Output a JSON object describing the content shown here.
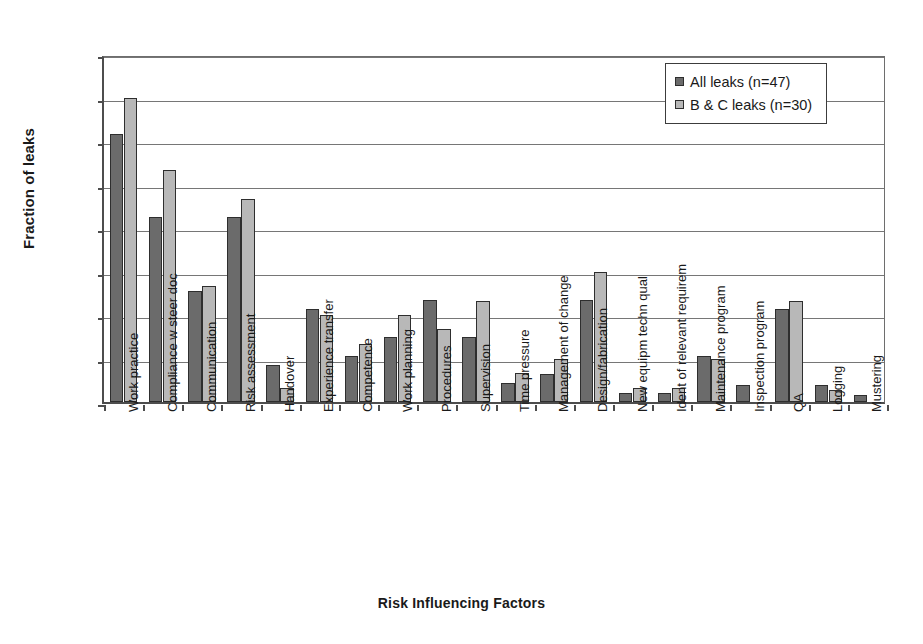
{
  "chart_data": {
    "type": "bar",
    "title": "",
    "xlabel": "Risk Influencing Factors",
    "ylabel": "Fraction of leaks",
    "ylim": [
      0,
      0.8
    ],
    "ytick_labels": [
      "0.8",
      "0.7",
      "0.6",
      "0.5",
      "0.4",
      "0.3",
      "0.2",
      "0.1",
      "0"
    ],
    "ytick_values": [
      0.8,
      0.7,
      0.6,
      0.5,
      0.4,
      0.3,
      0.2,
      0.1,
      0
    ],
    "grid": "horizontal",
    "legend_position": "top-right",
    "categories": [
      "Work practice",
      "Compliance w steer doc",
      "Communication",
      "Risk assessment",
      "Handover",
      "Experience transfer",
      "Competence",
      "Work planning",
      "Procedures",
      "Supervision",
      "Time pressure",
      "Management of change",
      "Design/fabrication",
      "New equipm techn qual",
      "Ident of relevant requirem",
      "Maintenance program",
      "Inspection program",
      "QA",
      "Logging",
      "Mustering"
    ],
    "series": [
      {
        "name": "All leaks (n=47)",
        "color": "#6b6b6b",
        "values": [
          0.617,
          0.426,
          0.255,
          0.426,
          0.085,
          0.213,
          0.106,
          0.149,
          0.234,
          0.149,
          0.043,
          0.064,
          0.234,
          0.021,
          0.021,
          0.106,
          0.038,
          0.213,
          0.038,
          0.017
        ]
      },
      {
        "name": "B & C leaks (n=30)",
        "color": "#b8b8b8",
        "values": [
          0.7,
          0.533,
          0.267,
          0.467,
          0.033,
          0.2,
          0.133,
          0.2,
          0.167,
          0.233,
          0.067,
          0.1,
          0.3,
          0.033,
          0.033,
          0.1,
          0,
          0.233,
          0.027,
          0
        ]
      }
    ]
  }
}
